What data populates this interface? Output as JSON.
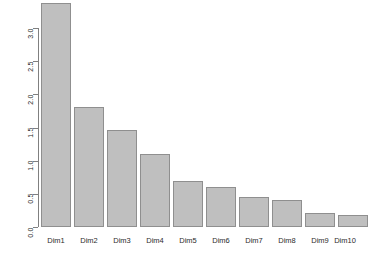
{
  "chart_data": {
    "type": "bar",
    "title": "",
    "subtitle": "",
    "xlabel": "",
    "ylabel": "",
    "categories": [
      "Dim1",
      "Dim2",
      "Dim3",
      "Dim4",
      "Dim5",
      "Dim6",
      "Dim7",
      "Dim8",
      "Dim9",
      "Dim10"
    ],
    "values": [
      3.26,
      1.74,
      1.41,
      1.06,
      0.67,
      0.58,
      0.44,
      0.39,
      0.21,
      0.18
    ],
    "series": [
      {
        "name": "eigenvalue",
        "values": [
          3.26,
          1.74,
          1.41,
          1.06,
          0.67,
          0.58,
          0.44,
          0.39,
          0.21,
          0.18
        ]
      }
    ],
    "ylim": [
      0.0,
      3.3
    ],
    "xlim": [
      0,
      10
    ],
    "y_ticks": [
      0.0,
      0.5,
      1.0,
      1.5,
      2.0,
      2.5,
      3.0
    ],
    "y_tick_labels": [
      "0.0",
      "0.5",
      "1.0",
      "1.5",
      "2.0",
      "2.5",
      "3.0"
    ],
    "x_tick_labels": [
      "Dim1",
      "Dim2",
      "Dim3",
      "Dim4",
      "Dim5",
      "Dim6",
      "Dim7",
      "Dim8",
      "Dim9",
      "Dim10"
    ],
    "grid": false,
    "legend": null,
    "legend_position": "none",
    "annotations": [],
    "bar_fill_color": "#bfbfbf",
    "bar_border_color": "#8f8f8f",
    "axis_color": "#808080",
    "background_color": "#ffffff",
    "y_label_rotation": 90
  }
}
